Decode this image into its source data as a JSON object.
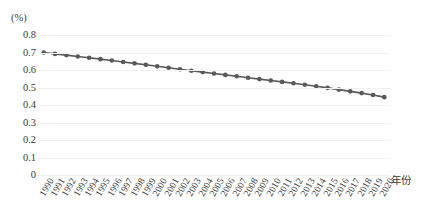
{
  "chart_data": {
    "type": "line",
    "title": "",
    "subtitle": "",
    "xlabel": "年份",
    "ylabel": "(%)",
    "ylim": [
      0,
      0.8
    ],
    "ytick_labels": [
      "0.8",
      "0.7",
      "0.6",
      "0.5",
      "0.4",
      "0.3",
      "0.2",
      "0.1",
      "0"
    ],
    "ytick_values": [
      0.8,
      0.7,
      0.6,
      0.5,
      0.4,
      0.3,
      0.2,
      0.1,
      0
    ],
    "grid": true,
    "grid_axis": "y",
    "legend": false,
    "legend_position": "none",
    "marker": "circle",
    "line_color": "#595959",
    "marker_color": "#595959",
    "categories": [
      "1990",
      "1991",
      "1992",
      "1993",
      "1994",
      "1995",
      "1996",
      "1997",
      "1998",
      "1999",
      "2000",
      "2001",
      "2002",
      "2003",
      "2004",
      "2005",
      "2006",
      "2007",
      "2008",
      "2009",
      "2010",
      "2011",
      "2012",
      "2013",
      "2014",
      "2015",
      "2016",
      "2017",
      "2018",
      "2019",
      "2020"
    ],
    "x": [
      1990,
      1991,
      1992,
      1993,
      1994,
      1995,
      1996,
      1997,
      1998,
      1999,
      2000,
      2001,
      2002,
      2003,
      2004,
      2005,
      2006,
      2007,
      2008,
      2009,
      2010,
      2011,
      2012,
      2013,
      2014,
      2015,
      2016,
      2017,
      2018,
      2019,
      2020
    ],
    "values": [
      0.7,
      0.692,
      0.685,
      0.677,
      0.67,
      0.662,
      0.654,
      0.646,
      0.638,
      0.63,
      0.621,
      0.613,
      0.604,
      0.596,
      0.588,
      0.58,
      0.572,
      0.564,
      0.556,
      0.548,
      0.54,
      0.532,
      0.524,
      0.516,
      0.507,
      0.498,
      0.488,
      0.478,
      0.468,
      0.457,
      0.445
    ],
    "annotations": []
  },
  "axis": {
    "unit_label": "(%)",
    "x_axis_title": "年份"
  }
}
